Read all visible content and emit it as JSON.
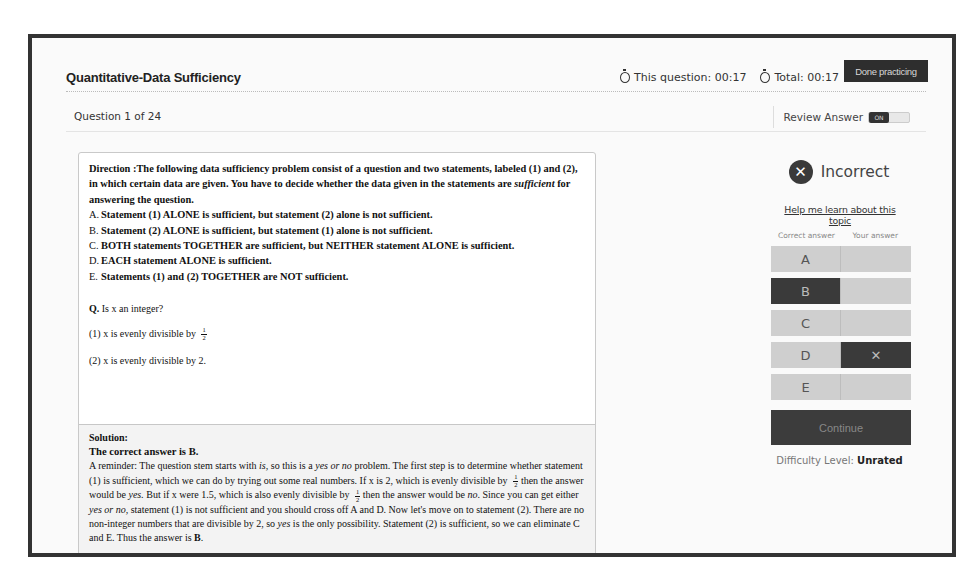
{
  "header": {
    "title": "Quantitative-Data Sufficiency",
    "timer_question_label": "This question: 00:17",
    "timer_total_label": "Total: 00:17",
    "done_button": "Done practicing"
  },
  "subheader": {
    "question_count": "Question 1 of 24",
    "review_label": "Review Answer",
    "toggle_state": "ON"
  },
  "question": {
    "direction_prefix": "Direction :The following data sufficiency problem consist of a question and two statements, labeled (1) and (2), in which certain data are given. You have to decide whether the data given in the statements are ",
    "direction_italic": "sufficient",
    "direction_suffix": " for answering the question.",
    "options": [
      {
        "letter": "A.",
        "text": "Statement (1) ALONE is sufficient, but statement (2) alone is not sufficient."
      },
      {
        "letter": "B.",
        "text": "Statement (2) ALONE is sufficient, but statement (1) alone is not sufficient."
      },
      {
        "letter": "C.",
        "text": "BOTH statements TOGETHER are sufficient, but NEITHER statement ALONE is sufficient."
      },
      {
        "letter": "D.",
        "text": "EACH statement ALONE is sufficient."
      },
      {
        "letter": "E.",
        "text": "Statements (1) and (2) TOGETHER are NOT sufficient."
      }
    ],
    "q_label": "Q.",
    "q_text": " Is x an integer?",
    "statement1": "(1) x is evenly divisible by",
    "statement1_frac": {
      "num": "1",
      "den": "2"
    },
    "statement2": "(2) x is evenly divisible by 2."
  },
  "solution": {
    "title": "Solution:",
    "answer": "The correct answer is B.",
    "paragraph": [
      "A reminder: The question stem starts with ",
      "is,",
      " so this is a ",
      "yes or no",
      " problem. The first step is to determine whether statement (1) is sufficient, which we can do by trying out some real numbers. If x is 2, which is evenly divisible by ",
      " then the answer would be ",
      "yes.",
      " But if x were 1.5, which is also evenly divisible by ",
      " then the answer would be ",
      "no",
      ". Since you can get either ",
      "yes or no,",
      " statement (1) is not sufficient and you should cross off A and D. Now let's move on to statement (2). There are no non-integer numbers that are divisible by 2, so ",
      "yes",
      " is the only possibility. Statement (2) is sufficient, so we can eliminate C and E. Thus the answer is ",
      "B",
      "."
    ]
  },
  "result": {
    "verdict": "Incorrect",
    "help_link": "Help me learn about this topic",
    "col_correct": "Correct answer",
    "col_yours": "Your answer",
    "rows": [
      {
        "letter": "A",
        "correct": false,
        "yours": false
      },
      {
        "letter": "B",
        "correct": true,
        "yours": false
      },
      {
        "letter": "C",
        "correct": false,
        "yours": false
      },
      {
        "letter": "D",
        "correct": false,
        "yours": true
      },
      {
        "letter": "E",
        "correct": false,
        "yours": false
      }
    ],
    "your_mark": "✕",
    "continue_button": "Continue",
    "difficulty_label": "Difficulty Level: ",
    "difficulty_value": "Unrated"
  },
  "colors": {
    "frame": "#333333",
    "dark_button": "#2e2e2e",
    "answer_cell": "#cfcfcf",
    "answer_cell_selected": "#3a3a3a"
  }
}
